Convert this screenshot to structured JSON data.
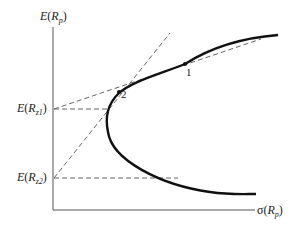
{
  "diagram": {
    "type": "efficient-frontier",
    "y_axis_label": {
      "func": "E",
      "var": "R",
      "sub": "p"
    },
    "x_axis_label": {
      "func": "σ",
      "var": "R",
      "sub": "p"
    },
    "intercepts": [
      {
        "func": "E",
        "var": "R",
        "sub": "z1"
      },
      {
        "func": "E",
        "var": "R",
        "sub": "z2"
      }
    ],
    "points": [
      {
        "label": "1"
      },
      {
        "label": "2"
      }
    ],
    "colors": {
      "curve": "#111111",
      "axis": "#555555",
      "dashed": "#666666"
    }
  }
}
